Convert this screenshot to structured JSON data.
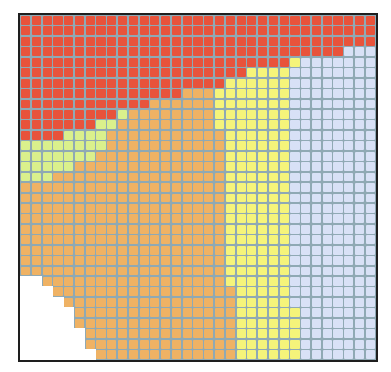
{
  "grid": {
    "cols": 33,
    "rows": 33,
    "palette": {
      "R": "#e8533b",
      "O": "#efb264",
      "Y": "#f5f47a",
      "G": "#daf08c",
      "B": "#d8e1f6",
      "W": "#ffffff"
    },
    "line_colors": {
      "R": "#8b7f9a",
      "O": "#9fb3a0",
      "Y": "#9fc0a6",
      "G": "#a3c0a8",
      "B": "#a9c4ea",
      "W": "#ffffff"
    },
    "rows_runs": [
      [
        [
          "R",
          33
        ]
      ],
      [
        [
          "R",
          33
        ]
      ],
      [
        [
          "R",
          33
        ]
      ],
      [
        [
          "R",
          30
        ],
        [
          "B",
          3
        ]
      ],
      [
        [
          "R",
          25
        ],
        [
          "Y",
          1
        ],
        [
          "B",
          7
        ]
      ],
      [
        [
          "R",
          21
        ],
        [
          "Y",
          4
        ],
        [
          "B",
          8
        ]
      ],
      [
        [
          "R",
          19
        ],
        [
          "Y",
          6
        ],
        [
          "B",
          8
        ]
      ],
      [
        [
          "R",
          15
        ],
        [
          "O",
          3
        ],
        [
          "Y",
          7
        ],
        [
          "B",
          8
        ]
      ],
      [
        [
          "R",
          12
        ],
        [
          "O",
          6
        ],
        [
          "Y",
          7
        ],
        [
          "B",
          8
        ]
      ],
      [
        [
          "R",
          9
        ],
        [
          "G",
          1
        ],
        [
          "O",
          8
        ],
        [
          "Y",
          7
        ],
        [
          "B",
          8
        ]
      ],
      [
        [
          "R",
          7
        ],
        [
          "G",
          2
        ],
        [
          "O",
          9
        ],
        [
          "Y",
          7
        ],
        [
          "B",
          8
        ]
      ],
      [
        [
          "R",
          4
        ],
        [
          "G",
          4
        ],
        [
          "O",
          11
        ],
        [
          "Y",
          6
        ],
        [
          "B",
          8
        ]
      ],
      [
        [
          "G",
          8
        ],
        [
          "O",
          11
        ],
        [
          "Y",
          6
        ],
        [
          "B",
          8
        ]
      ],
      [
        [
          "G",
          7
        ],
        [
          "O",
          12
        ],
        [
          "Y",
          6
        ],
        [
          "B",
          8
        ]
      ],
      [
        [
          "G",
          5
        ],
        [
          "O",
          14
        ],
        [
          "Y",
          6
        ],
        [
          "B",
          8
        ]
      ],
      [
        [
          "G",
          3
        ],
        [
          "O",
          16
        ],
        [
          "Y",
          6
        ],
        [
          "B",
          8
        ]
      ],
      [
        [
          "O",
          19
        ],
        [
          "Y",
          6
        ],
        [
          "B",
          8
        ]
      ],
      [
        [
          "O",
          19
        ],
        [
          "Y",
          6
        ],
        [
          "B",
          8
        ]
      ],
      [
        [
          "O",
          19
        ],
        [
          "Y",
          6
        ],
        [
          "B",
          8
        ]
      ],
      [
        [
          "O",
          19
        ],
        [
          "Y",
          6
        ],
        [
          "B",
          8
        ]
      ],
      [
        [
          "O",
          19
        ],
        [
          "Y",
          6
        ],
        [
          "B",
          8
        ]
      ],
      [
        [
          "O",
          19
        ],
        [
          "Y",
          6
        ],
        [
          "B",
          8
        ]
      ],
      [
        [
          "O",
          19
        ],
        [
          "Y",
          6
        ],
        [
          "B",
          8
        ]
      ],
      [
        [
          "O",
          19
        ],
        [
          "Y",
          6
        ],
        [
          "B",
          8
        ]
      ],
      [
        [
          "O",
          19
        ],
        [
          "Y",
          6
        ],
        [
          "B",
          8
        ]
      ],
      [
        [
          "W",
          2
        ],
        [
          "O",
          17
        ],
        [
          "Y",
          6
        ],
        [
          "B",
          8
        ]
      ],
      [
        [
          "W",
          3
        ],
        [
          "O",
          17
        ],
        [
          "Y",
          5
        ],
        [
          "B",
          8
        ]
      ],
      [
        [
          "W",
          4
        ],
        [
          "O",
          16
        ],
        [
          "Y",
          5
        ],
        [
          "B",
          8
        ]
      ],
      [
        [
          "W",
          5
        ],
        [
          "O",
          15
        ],
        [
          "Y",
          6
        ],
        [
          "B",
          7
        ]
      ],
      [
        [
          "W",
          5
        ],
        [
          "O",
          15
        ],
        [
          "Y",
          6
        ],
        [
          "B",
          7
        ]
      ],
      [
        [
          "W",
          6
        ],
        [
          "O",
          14
        ],
        [
          "Y",
          6
        ],
        [
          "B",
          7
        ]
      ],
      [
        [
          "W",
          6
        ],
        [
          "O",
          14
        ],
        [
          "Y",
          6
        ],
        [
          "B",
          7
        ]
      ],
      [
        [
          "W",
          7
        ],
        [
          "O",
          13
        ],
        [
          "Y",
          6
        ],
        [
          "B",
          7
        ]
      ]
    ]
  },
  "legend_of_regions": {
    "R": "red region (top band, diagonal lower edge)",
    "O": "orange region (center-left)",
    "Y": "yellow region (center-right column band)",
    "G": "light green region (left wedge)",
    "B": "light blue region (right column band)",
    "W": "white empty region (bottom-left staircase)"
  }
}
